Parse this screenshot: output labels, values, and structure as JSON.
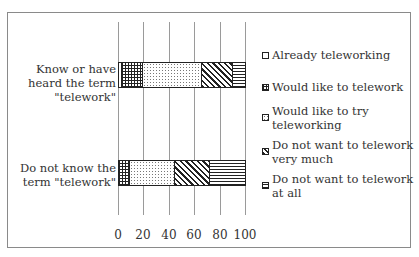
{
  "chart_data": {
    "type": "bar",
    "orientation": "horizontal",
    "stacked": true,
    "title": "",
    "xlabel": "",
    "ylabel": "",
    "xlim": [
      0,
      100
    ],
    "x_ticks": [
      "0",
      "20",
      "40",
      "60",
      "80",
      "100"
    ],
    "grid": true,
    "legend_position": "right",
    "categories": [
      "Know or have heard the term \"telework\"",
      "Do not know the term \"telework\""
    ],
    "series": [
      {
        "name": "Already teleworking",
        "pattern": "empty",
        "values": [
          2,
          0
        ]
      },
      {
        "name": "Would like to telework",
        "pattern": "grid",
        "values": [
          17,
          9
        ]
      },
      {
        "name": "Would like to try teleworking",
        "pattern": "dots",
        "values": [
          46,
          35
        ]
      },
      {
        "name": "Do not want to telework very much",
        "pattern": "diagonal",
        "values": [
          25,
          28
        ]
      },
      {
        "name": "Do not want to telework at all",
        "pattern": "horizontal-lines",
        "values": [
          10,
          28
        ]
      }
    ]
  },
  "labels": {
    "cat0": "Know or have\nheard the term\n\"telework\"",
    "cat1": "Do not know the\nterm \"telework\""
  },
  "legend": [
    {
      "text": "Already teleworking"
    },
    {
      "text": "Would like to telework"
    },
    {
      "text": "Would like to try\nteleworking"
    },
    {
      "text": "Do not want to telework\nvery much"
    },
    {
      "text": "Do not want to telework\nat all"
    }
  ]
}
